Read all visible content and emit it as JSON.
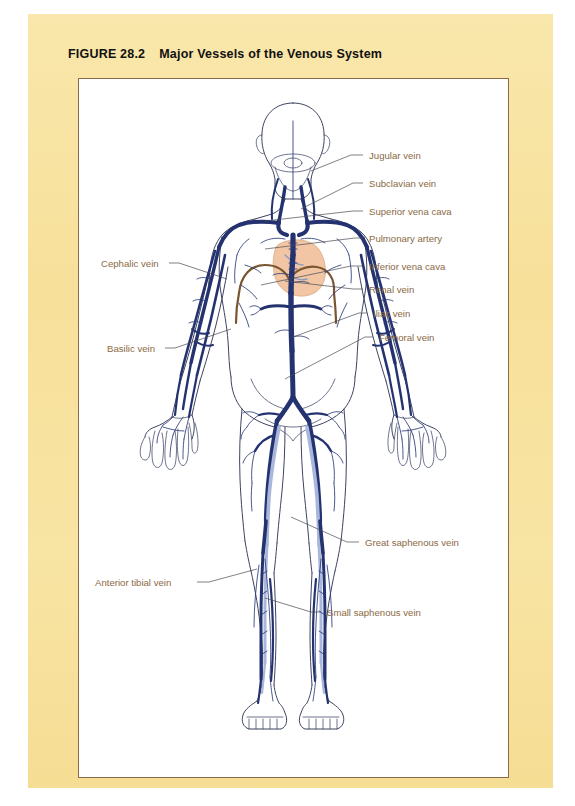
{
  "figure": {
    "number": "FIGURE 28.2",
    "title": "Major Vessels of the Venous System"
  },
  "colors": {
    "panel_background": "#f8e39c",
    "plate_background": "#ffffff",
    "plate_border": "#8a6a47",
    "label_text": "#8a6a45",
    "leader_line": "#4a4a52",
    "body_outline": "#3d4360",
    "vein_dark": "#243370",
    "vein_light": "#a9b7dc",
    "artery_brown": "#7a5630",
    "heart_fill": "#f2c6a5",
    "title_text": "#111111"
  },
  "diagram": {
    "labels": [
      {
        "id": "jugular-vein",
        "text": "Jugular vein",
        "side": "right",
        "text_x": 290,
        "text_y": 80,
        "leader": "M 284 76 L 272 76 L 232 92"
      },
      {
        "id": "subclavian-vein",
        "text": "Subclavian vein",
        "side": "right",
        "text_x": 290,
        "text_y": 108,
        "leader": "M 284 104 L 274 104 L 222 130"
      },
      {
        "id": "superior-vena-cava",
        "text": "Superior vena cava",
        "side": "right",
        "text_x": 290,
        "text_y": 136,
        "leader": "M 284 132 L 274 132 L 186 142"
      },
      {
        "id": "pulmonary-artery",
        "text": "Pulmonary artery",
        "side": "right",
        "text_x": 290,
        "text_y": 163,
        "leader": "M 284 159 L 276 159 L 186 170"
      },
      {
        "id": "inferior-vena-cava",
        "text": "Inferior vena cava",
        "side": "right",
        "text_x": 290,
        "text_y": 191,
        "leader": "M 284 187 L 272 187 L 182 206"
      },
      {
        "id": "renal-vein",
        "text": "Renal vein",
        "side": "right",
        "text_x": 290,
        "text_y": 214,
        "leader": "M 284 210 L 274 210 L 206 202"
      },
      {
        "id": "iliac-vein",
        "text": "Iliac vein",
        "side": "right",
        "text_x": 294,
        "text_y": 238,
        "leader": "M 288 234 L 280 234 L 214 258"
      },
      {
        "id": "femoral-vein",
        "text": "Femoral vein",
        "side": "right",
        "text_x": 300,
        "text_y": 262,
        "leader": "M 294 258 L 286 258 L 206 300"
      },
      {
        "id": "cephalic-vein",
        "text": "Cephalic vein",
        "side": "left",
        "text_x": 22,
        "text_y": 188,
        "leader": "M 90 184 L 100 184 L 148 200"
      },
      {
        "id": "basilic-vein",
        "text": "Basilic vein",
        "side": "left",
        "text_x": 28,
        "text_y": 273,
        "leader": "M 86 269 L 96 269 L 152 250"
      },
      {
        "id": "great-saphenous-vein",
        "text": "Great saphenous vein",
        "side": "right",
        "text_x": 286,
        "text_y": 467,
        "leader": "M 280 463 L 268 463 L 212 438"
      },
      {
        "id": "anterior-tibial-vein",
        "text": "Anterior tibial vein",
        "side": "left",
        "text_x": 16,
        "text_y": 507,
        "leader": "M 118 503 L 130 503 L 178 490"
      },
      {
        "id": "small-saphenous-vein",
        "text": "Small saphenous vein",
        "side": "right",
        "text_x": 248,
        "text_y": 537,
        "leader": "M 242 533 L 232 533 L 186 519"
      }
    ],
    "structures": [
      {
        "id": "head",
        "name": "head and neck outline"
      },
      {
        "id": "torso",
        "name": "torso outline"
      },
      {
        "id": "arms",
        "name": "arms and hands outline"
      },
      {
        "id": "legs",
        "name": "legs and feet outline"
      },
      {
        "id": "heart",
        "name": "heart"
      },
      {
        "id": "aorta",
        "name": "aortic arch and descending aorta"
      },
      {
        "id": "veins",
        "name": "venous network"
      }
    ]
  }
}
